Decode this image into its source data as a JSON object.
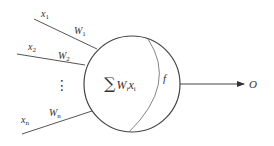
{
  "diagram": {
    "type": "artificial-neuron-model",
    "inputs": [
      {
        "label": "x",
        "sub": "1",
        "weight": "W",
        "weight_sub": "1"
      },
      {
        "label": "x",
        "sub": "2",
        "weight": "W",
        "weight_sub": "2"
      },
      {
        "label": "x",
        "sub": "n",
        "weight": "W",
        "weight_sub": "n"
      }
    ],
    "ellipsis": "⋮",
    "summation": {
      "symbol": "∑",
      "text": "W",
      "w_sub": "i",
      "x": "x",
      "x_sub": "i"
    },
    "activation": "f",
    "output": "O",
    "colors": {
      "stroke": "#444444",
      "text": "#333333"
    }
  }
}
